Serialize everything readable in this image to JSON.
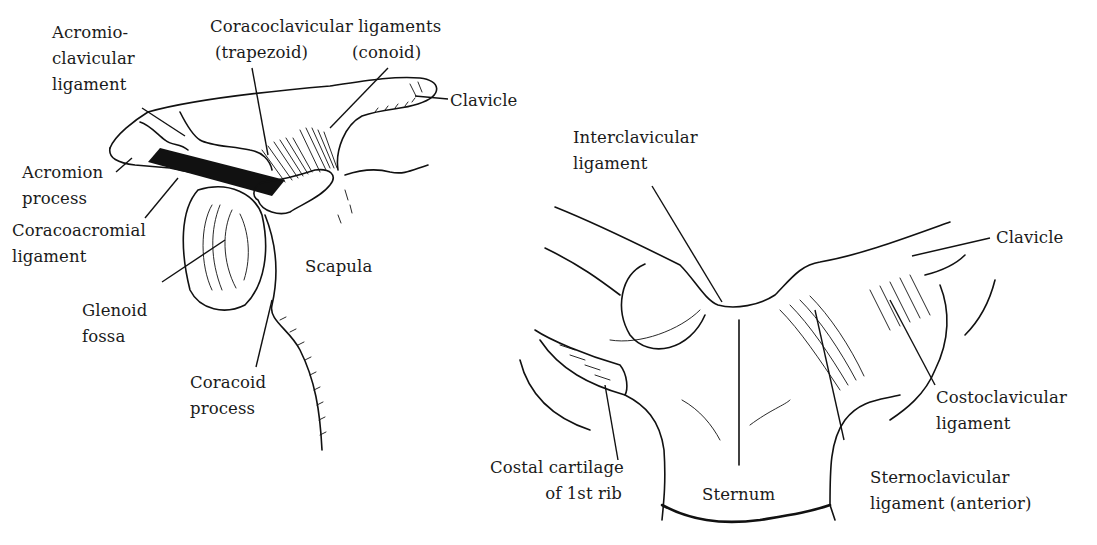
{
  "figure": {
    "panels": [
      {
        "id": "acromioclavicular-joint",
        "labels": {
          "acromioclavicular_ligament": "Acromio-\nclavicular\nligament",
          "coracoclavicular_title": "Coracoclavicular ligaments",
          "trapezoid": "(trapezoid)",
          "conoid": "(conoid)",
          "clavicle": "Clavicle",
          "acromion_process": "Acromion\nprocess",
          "coracoacromial_ligament": "Coracoacromial\nligament",
          "scapula": "Scapula",
          "glenoid_fossa": "Glenoid\nfossa",
          "coracoid_process": "Coracoid\nprocess"
        }
      },
      {
        "id": "sternoclavicular-joint",
        "labels": {
          "interclavicular_ligament": "Interclavicular\nligament",
          "clavicle": "Clavicle",
          "costoclavicular_ligament": "Costoclavicular\nligament",
          "costal_cartilage": "Costal cartilage\nof 1st rib",
          "sternum": "Sternum",
          "sternoclavicular_ligament": "Sternoclavicular\nligament (anterior)"
        }
      }
    ],
    "colors": {
      "ink": "#111111",
      "background": "#ffffff"
    }
  }
}
